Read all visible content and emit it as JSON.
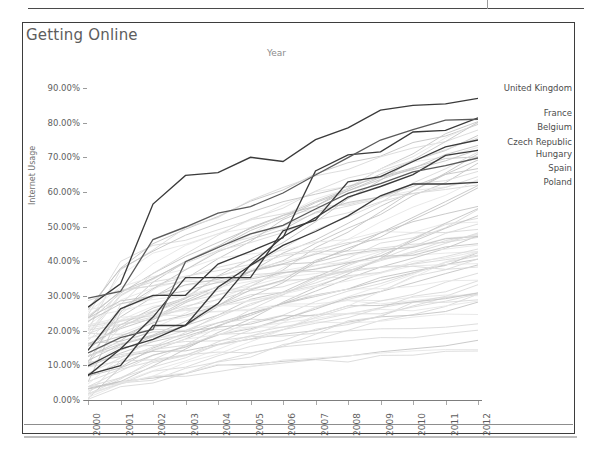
{
  "document": {
    "top_rule": true
  },
  "chart": {
    "title": "Getting Online",
    "top_axis_title": "Year",
    "y_axis_label": "Internet Usage"
  },
  "chart_data": {
    "type": "line",
    "title": "Getting Online",
    "xlabel": "Year",
    "ylabel": "Internet Usage",
    "xlim": [
      2000,
      2012
    ],
    "ylim": [
      0.0,
      90.0
    ],
    "grid": false,
    "legend_position": "right-inline-labels",
    "x": [
      2000,
      2001,
      2002,
      2003,
      2004,
      2005,
      2006,
      2007,
      2008,
      2009,
      2010,
      2011,
      2012
    ],
    "y_ticks": [
      "0.00%",
      "10.00%",
      "20.00%",
      "30.00%",
      "40.00%",
      "50.00%",
      "60.00%",
      "70.00%",
      "80.00%",
      "90.00%"
    ],
    "x_ticks": [
      "2000",
      "2001",
      "2002",
      "2003",
      "2004",
      "2005",
      "2006",
      "2007",
      "2008",
      "2009",
      "2010",
      "2011",
      "2012"
    ],
    "highlighted_series": [
      {
        "name": "United Kingdom",
        "values": [
          26.8,
          33.5,
          56.5,
          64.8,
          65.6,
          70.0,
          68.8,
          75.1,
          78.5,
          83.6,
          85.0,
          85.4,
          87.0
        ]
      },
      {
        "name": "France",
        "values": [
          14.3,
          26.3,
          30.2,
          30.2,
          39.2,
          42.9,
          46.8,
          66.1,
          70.7,
          71.6,
          77.3,
          77.8,
          81.4
        ]
      },
      {
        "name": "Belgium",
        "values": [
          29.4,
          31.3,
          46.3,
          49.9,
          53.9,
          55.8,
          59.7,
          64.9,
          69.9,
          75.0,
          78.0,
          80.7,
          81.0
        ]
      },
      {
        "name": "Czech Republic",
        "values": [
          9.8,
          14.7,
          23.9,
          35.3,
          35.3,
          35.3,
          48.8,
          51.9,
          62.9,
          64.4,
          68.8,
          73.0,
          75.0
        ]
      },
      {
        "name": "Hungary",
        "values": [
          7.0,
          14.7,
          17.5,
          21.6,
          27.8,
          39.0,
          47.1,
          52.6,
          58.5,
          61.6,
          65.0,
          70.6,
          72.0
        ]
      },
      {
        "name": "Spain",
        "values": [
          13.6,
          18.0,
          20.4,
          39.9,
          44.0,
          47.9,
          50.4,
          55.1,
          59.6,
          62.4,
          65.8,
          67.6,
          69.8
        ]
      },
      {
        "name": "Poland",
        "values": [
          7.3,
          9.9,
          21.5,
          21.5,
          32.5,
          38.8,
          44.6,
          48.6,
          53.1,
          58.9,
          62.3,
          62.3,
          62.8
        ]
      }
    ],
    "background_series_note": "Approximately 70 additional country series rendered in light grey, spanning roughly 0%–85% over 2000–2012",
    "annotations": [
      {
        "text": "United Kingdom",
        "x": 2012,
        "y": 87.0
      },
      {
        "text": "France",
        "x": 2012,
        "y": 81.4
      },
      {
        "text": "Belgium",
        "x": 2012,
        "y": 81.0
      },
      {
        "text": "Czech Republic",
        "x": 2012,
        "y": 75.0
      },
      {
        "text": "Hungary",
        "x": 2012,
        "y": 72.0
      },
      {
        "text": "Spain",
        "x": 2012,
        "y": 69.8
      },
      {
        "text": "Poland",
        "x": 2012,
        "y": 62.8
      }
    ],
    "colors": {
      "highlight": "#3a3a3a",
      "background": "#d9d9d9",
      "text": "#5e5e5e",
      "frame": "#3d3d3d"
    }
  }
}
